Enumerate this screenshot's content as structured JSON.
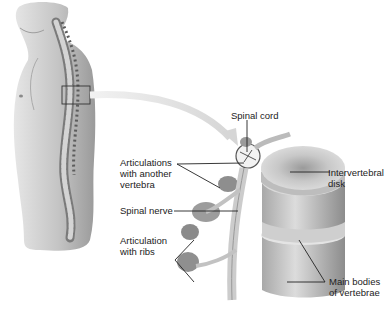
{
  "figure": {
    "type": "anatomical-diagram",
    "colors": {
      "background": "#ffffff",
      "skin": "#c9c9c9",
      "bone": "#d8d8d8",
      "bone_shadow": "#8a8a8a",
      "line": "#222222",
      "arrow": "#e2e2e2",
      "highlight_box": "#333333"
    }
  },
  "labels": {
    "spinal_cord": "Spinal cord",
    "articulations_vertebra": "Articulations\nwith another\nvertebra",
    "intervertebral_disk": "Intervertebral\ndisk",
    "spinal_nerve": "Spinal nerve",
    "articulation_ribs": "Articulation\nwith ribs",
    "main_bodies": "Main bodies\nof vertebrae"
  }
}
